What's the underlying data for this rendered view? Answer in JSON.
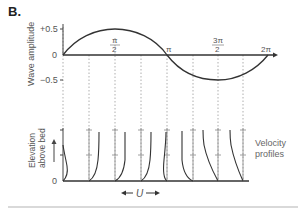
{
  "panel": {
    "label": "B."
  },
  "top_plot": {
    "ylabel": "Wave amplitude",
    "yticks": [
      "+0.5",
      "0",
      "−0.5"
    ],
    "phase_labels": {
      "half_pi_num": "π",
      "half_pi_den": "2",
      "pi": "π",
      "three_half_pi_num": "3π",
      "three_half_pi_den": "2",
      "two_pi": "2π"
    },
    "curve": "sine wave, amplitude 0.5, one full period 0 to 2π"
  },
  "bottom_plot": {
    "ylabel_line1": "Elevation",
    "ylabel_line2": "above bed",
    "yzero": "0",
    "side_label_line1": "Velocity",
    "side_label_line2": "profiles",
    "velocity_label": "U",
    "profile_count": 8
  },
  "colors": {
    "line": "#333333",
    "dotted": "#999999",
    "text": "#555555",
    "divider": "#d9d9d9"
  }
}
